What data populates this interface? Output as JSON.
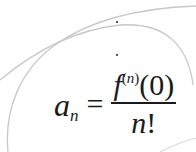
{
  "formula": {
    "lhs_base": "a",
    "lhs_sub": "n",
    "equals": "=",
    "numerator_fn": "f",
    "numerator_sup_open": "(",
    "numerator_sup_var": "n",
    "numerator_sup_close": ")",
    "numerator_arg": "(0)",
    "denominator_var": "n",
    "denominator_op": "!"
  },
  "decorations": {
    "arc_color": "#c8c8c8",
    "dot_color": "#222222",
    "dots": [
      {
        "x": 117,
        "y": 22
      },
      {
        "x": 117,
        "y": 55
      }
    ]
  }
}
